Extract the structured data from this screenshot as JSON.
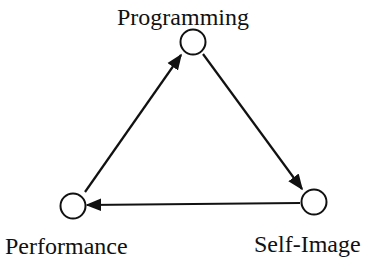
{
  "diagram": {
    "type": "directed-cycle",
    "nodes": [
      {
        "id": "programming",
        "label": "Programming"
      },
      {
        "id": "self-image",
        "label": "Self-Image"
      },
      {
        "id": "performance",
        "label": "Performance"
      }
    ],
    "edges": [
      {
        "from": "programming",
        "to": "self-image"
      },
      {
        "from": "self-image",
        "to": "performance"
      },
      {
        "from": "performance",
        "to": "programming"
      }
    ]
  }
}
